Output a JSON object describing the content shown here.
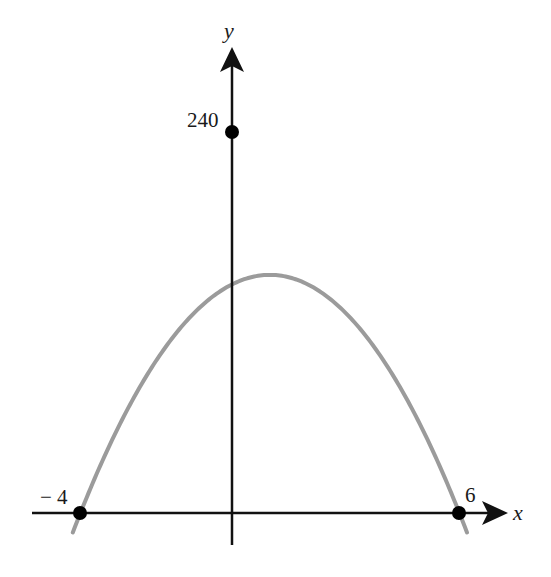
{
  "chart_data": {
    "type": "line",
    "title": "",
    "xlabel": "x",
    "ylabel": "y",
    "function": "y = -6(x + 4)(x - 6)",
    "grid": false,
    "legend": null,
    "curve_color": "#9b9b9b",
    "axis_color": "#111111",
    "point_color": "#000000",
    "labeled_points": [
      {
        "x": -4,
        "y": 0,
        "label": "− 4"
      },
      {
        "x": 6,
        "y": 0,
        "label": "6"
      },
      {
        "x": 0,
        "y": 240,
        "label": "240"
      }
    ],
    "xlim": [
      -6,
      7.5
    ],
    "ylim": [
      -20,
      300
    ],
    "x_domain_drawn": [
      -4.2,
      6.2
    ],
    "series": [
      {
        "name": "parabola",
        "x": [
          -4.2,
          -4,
          -3,
          -2,
          -1,
          0,
          1,
          2,
          3,
          4,
          5,
          6,
          6.2
        ],
        "y": [
          -12.24,
          0,
          54,
          96,
          126,
          144,
          150,
          144,
          126,
          96,
          54,
          0,
          -12.24
        ]
      }
    ],
    "vertex": {
      "x": 1,
      "y": 246
    }
  },
  "labels": {
    "x_axis": "x",
    "y_axis": "y",
    "y_intercept": "240",
    "x_intercept_left": "− 4",
    "x_intercept_right": "6"
  }
}
